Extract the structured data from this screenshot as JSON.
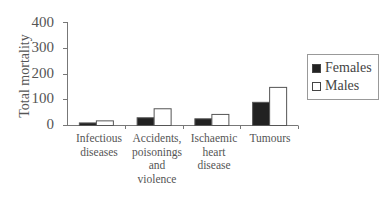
{
  "chart_data": {
    "type": "bar",
    "title": "",
    "xlabel": "",
    "ylabel": "Total mortality",
    "ylim": [
      0,
      400
    ],
    "yticks": [
      0,
      100,
      200,
      300,
      400
    ],
    "grid": false,
    "legend_position": "right",
    "categories": [
      "Infectious diseases",
      "Accidents, poisonings and violence",
      "Ischaemic heart disease",
      "Tumours"
    ],
    "series": [
      {
        "name": "Females",
        "color": "#222222",
        "values": [
          10,
          30,
          26,
          90
        ]
      },
      {
        "name": "Males",
        "color": "#ffffff",
        "values": [
          18,
          65,
          43,
          148
        ]
      }
    ]
  },
  "axis": {
    "ylabel": "Total mortality",
    "ticks": [
      "400",
      "300",
      "200",
      "100",
      "0"
    ]
  },
  "categories": [
    {
      "lines": [
        "Infectious",
        "diseases"
      ]
    },
    {
      "lines": [
        "Accidents,",
        "poisonings",
        "and",
        "violence"
      ]
    },
    {
      "lines": [
        "Ischaemic",
        "heart",
        "disease"
      ]
    },
    {
      "lines": [
        "Tumours"
      ]
    }
  ],
  "legend": {
    "females": "Females",
    "males": "Males"
  }
}
